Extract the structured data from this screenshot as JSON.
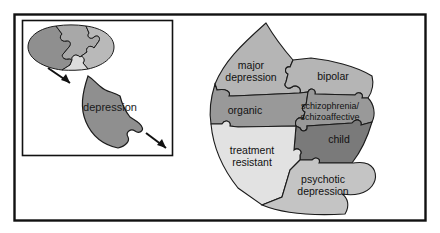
{
  "figure": {
    "background_color": "#ffffff",
    "frame": {
      "name": "outer-frame",
      "border_color": "#111111",
      "x": 14,
      "y": 14,
      "width": 412,
      "height": 207
    },
    "inset_panel": {
      "name": "inset-panel",
      "border_color": "#111111",
      "x": 22,
      "y": 20,
      "width": 150,
      "height": 135
    }
  },
  "inset": {
    "oval_puzzle": {
      "name": "oval-puzzle",
      "pieces": [
        {
          "id": "oval-piece-left",
          "color": "#8f8f8f"
        },
        {
          "id": "oval-piece-top",
          "color": "#a8a8a8"
        },
        {
          "id": "oval-piece-right",
          "color": "#b9b9b9"
        },
        {
          "id": "oval-piece-center",
          "color": "#dcdcdc"
        }
      ]
    },
    "extracted_piece": {
      "name": "depression-piece",
      "label": "depression",
      "color": "#8f8f8f"
    },
    "arrows": [
      {
        "id": "arrow-extract",
        "direction": "down-right"
      },
      {
        "id": "arrow-expand",
        "direction": "down-right"
      }
    ]
  },
  "main_diagram": {
    "name": "depression-spectrum-puzzle",
    "pieces": [
      {
        "id": "major-depression",
        "label_line1": "major",
        "label_line2": "depression",
        "color": "#b5b5b5"
      },
      {
        "id": "bipolar",
        "label_line1": "bipolar",
        "label_line2": "",
        "color": "#b5b5b5"
      },
      {
        "id": "organic",
        "label_line1": "organic",
        "label_line2": "",
        "color": "#999999"
      },
      {
        "id": "schizophrenia-schizoaffective",
        "label_line1": "schizophrenia/",
        "label_line2": "schizoaffective",
        "color": "#999999"
      },
      {
        "id": "child",
        "label_line1": "child",
        "label_line2": "",
        "color": "#7a7a7a"
      },
      {
        "id": "treatment-resistant",
        "label_line1": "treatment",
        "label_line2": "resistant",
        "color": "#e2e2e2"
      },
      {
        "id": "psychotic-depression",
        "label_line1": "psychotic",
        "label_line2": "depression",
        "color": "#c4c4c4"
      }
    ]
  },
  "colors": {
    "outline": "#1b1b1b",
    "text": "#111111",
    "lightest": "#e2e2e2",
    "light": "#c4c4c4",
    "medium_light": "#b5b5b5",
    "medium": "#999999",
    "dark": "#8f8f8f",
    "darkest": "#7a7a7a"
  }
}
